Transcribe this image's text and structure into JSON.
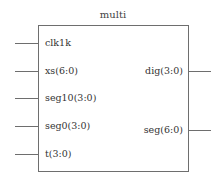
{
  "symbol": {
    "title": "multi",
    "stroke_color": "#6e6e6e",
    "text_color": "#333333",
    "inputs": [
      {
        "name": "clk1k",
        "y": 43
      },
      {
        "name": "xs(6:0)",
        "y": 71
      },
      {
        "name": "seg10(3:0)",
        "y": 98
      },
      {
        "name": "seg0(3:0)",
        "y": 126
      },
      {
        "name": "t(3:0)",
        "y": 154
      }
    ],
    "outputs": [
      {
        "name": "dig(3:0)",
        "y": 71
      },
      {
        "name": "seg(6:0)",
        "y": 130
      }
    ]
  }
}
